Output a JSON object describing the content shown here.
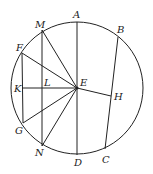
{
  "diagram": {
    "circle": {
      "cx": 77,
      "cy": 88,
      "r": 66
    },
    "center": {
      "label": "E",
      "x": 77,
      "y": 88
    },
    "points": {
      "A": {
        "label": "A",
        "x": 77,
        "y": 22
      },
      "B": {
        "label": "B",
        "x": 118,
        "y": 37
      },
      "C": {
        "label": "C",
        "x": 105,
        "y": 149
      },
      "D": {
        "label": "D",
        "x": 77,
        "y": 155
      },
      "E": {
        "label": "E",
        "x": 77,
        "y": 88
      },
      "F": {
        "label": "F",
        "x": 22,
        "y": 53
      },
      "G": {
        "label": "G",
        "x": 23,
        "y": 123
      },
      "H": {
        "label": "H",
        "x": 111,
        "y": 96
      },
      "K": {
        "label": "K",
        "x": 22,
        "y": 88
      },
      "L": {
        "label": "L",
        "x": 42,
        "y": 88
      },
      "M": {
        "label": "M",
        "x": 42,
        "y": 30
      },
      "N": {
        "label": "N",
        "x": 42,
        "y": 146
      }
    },
    "labels": {
      "A": "A",
      "B": "B",
      "C": "C",
      "D": "D",
      "E": "E",
      "F": "F",
      "G": "G",
      "H": "H",
      "K": "K",
      "L": "L",
      "M": "M",
      "N": "N"
    },
    "segments": [
      "AD",
      "BC",
      "EH",
      "MN",
      "FG",
      "KE",
      "EM",
      "EF",
      "EG",
      "EN"
    ]
  }
}
